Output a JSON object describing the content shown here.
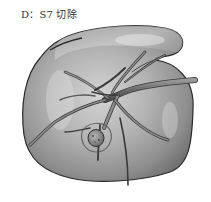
{
  "figure": {
    "caption": "D：S7 切除",
    "highlighted_segment": "S7",
    "procedure": "resection",
    "annotations": {
      "tumor": "tumor-nodule",
      "vessels": "hepatic-vessel-branches"
    },
    "colors": {
      "outline": "#2a2a2a",
      "surface_light": "#d9d9d9",
      "surface_mid": "#a6a6a6",
      "surface_dark": "#6b6b6b",
      "vessel": "#7d7d7d",
      "vessel_edge": "#3a3a3a",
      "tumor": "#8a8a8a"
    }
  }
}
